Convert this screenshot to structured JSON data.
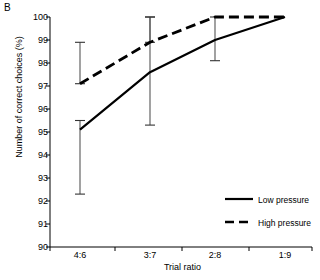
{
  "panel": {
    "label": "B"
  },
  "chart_data": {
    "type": "line",
    "title": "",
    "subtitle": "",
    "xlabel": "Trial ratio",
    "ylabel": "Number of correct choices (%)",
    "categories": [
      "4:6",
      "3:7",
      "2:8",
      "1:9"
    ],
    "ylim": [
      90,
      100
    ],
    "yticks": [
      90,
      91,
      92,
      93,
      94,
      95,
      96,
      97,
      98,
      99,
      100
    ],
    "ytick_labels": [
      "90",
      "91",
      "92",
      "93",
      "94",
      "95",
      "96",
      "97",
      "98",
      "99",
      "100"
    ],
    "grid": false,
    "legend_position": "lower-right",
    "series": [
      {
        "name": "Low pressure",
        "style": "solid",
        "color": "#000000",
        "values": [
          95.1,
          97.6,
          99.0,
          100.0
        ],
        "error_low": [
          92.3,
          95.3,
          98.1,
          100.0
        ],
        "error_high": [
          95.5,
          100.0,
          100.0,
          100.0
        ]
      },
      {
        "name": "High pressure",
        "style": "dashed",
        "color": "#000000",
        "values": [
          97.1,
          98.9,
          100.0,
          100.0
        ],
        "error_low": [
          97.1,
          98.9,
          100.0,
          100.0
        ],
        "error_high": [
          98.9,
          100.0,
          100.0,
          100.0
        ]
      }
    ]
  },
  "legend": {
    "items": [
      {
        "label": "Low pressure",
        "style": "solid"
      },
      {
        "label": "High pressure",
        "style": "dashed"
      }
    ]
  }
}
